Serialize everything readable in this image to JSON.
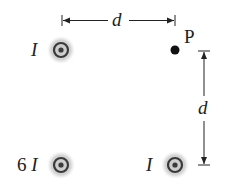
{
  "diagram": {
    "wires": [
      {
        "id": "top-left",
        "label": "I",
        "current_multiplier": 1,
        "direction": "out-of-page",
        "x": 61,
        "y": 50
      },
      {
        "id": "bottom-left",
        "label": "6 I",
        "current_multiplier": 6,
        "direction": "out-of-page",
        "x": 61,
        "y": 165
      },
      {
        "id": "bottom-right",
        "label": "I",
        "current_multiplier": 1,
        "direction": "out-of-page",
        "x": 175,
        "y": 165
      }
    ],
    "point": {
      "label": "P",
      "x": 175,
      "y": 50
    },
    "dimensions": {
      "horizontal": {
        "label": "d"
      },
      "vertical": {
        "label": "d"
      }
    },
    "colors": {
      "glow": "#c8c8c8",
      "ring": "#3a3a3a",
      "line": "#222222"
    }
  }
}
